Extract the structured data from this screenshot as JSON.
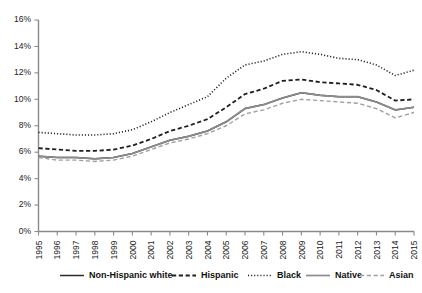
{
  "chart_data": {
    "type": "line",
    "title": "",
    "subtitle": "",
    "xlabel": "",
    "ylabel": "",
    "grid": false,
    "legend_position": "bottom",
    "xlim": [
      1995,
      2015
    ],
    "ylim": [
      0,
      16
    ],
    "ytick_labels": [
      "0%",
      "2%",
      "4%",
      "6%",
      "8%",
      "10%",
      "12%",
      "14%",
      "16%"
    ],
    "ytick_values": [
      0,
      2,
      4,
      6,
      8,
      10,
      12,
      14,
      16
    ],
    "x": [
      1995,
      1996,
      1997,
      1998,
      1999,
      2000,
      2001,
      2002,
      2003,
      2004,
      2005,
      2006,
      2007,
      2008,
      2009,
      2010,
      2011,
      2012,
      2013,
      2014,
      2015
    ],
    "xtick_labels": [
      "1995",
      "1996",
      "1997",
      "1998",
      "1999",
      "2000",
      "2001",
      "2002",
      "2003",
      "2004",
      "2005",
      "2006",
      "2007",
      "2008",
      "2009",
      "2010",
      "2011",
      "2012",
      "2013",
      "2014",
      "2015"
    ],
    "series": [
      {
        "name": "Non-Hispanic white",
        "style": "solid",
        "color": "#2b2b2b",
        "width": 1.5,
        "values": [
          5.7,
          5.6,
          5.6,
          5.5,
          5.6,
          5.9,
          6.4,
          6.9,
          7.2,
          7.6,
          8.3,
          9.3,
          9.6,
          10.1,
          10.5,
          10.3,
          10.2,
          10.2,
          9.8,
          9.2,
          9.4
        ]
      },
      {
        "name": "Hispanic",
        "style": "dashed",
        "color": "#1f1f1f",
        "width": 1.8,
        "values": [
          6.3,
          6.2,
          6.1,
          6.1,
          6.2,
          6.5,
          7.0,
          7.6,
          8.0,
          8.5,
          9.4,
          10.4,
          10.8,
          11.4,
          11.5,
          11.3,
          11.2,
          11.1,
          10.7,
          9.9,
          10.0
        ]
      },
      {
        "name": "Black",
        "style": "dotted",
        "color": "#1f1f1f",
        "width": 1.6,
        "values": [
          7.5,
          7.4,
          7.3,
          7.3,
          7.4,
          7.7,
          8.3,
          9.0,
          9.6,
          10.2,
          11.6,
          12.6,
          12.9,
          13.4,
          13.6,
          13.4,
          13.1,
          13.0,
          12.6,
          11.8,
          12.2
        ]
      },
      {
        "name": "Native",
        "style": "solid",
        "color": "#8c8c8c",
        "width": 1.7,
        "values": [
          5.7,
          5.6,
          5.6,
          5.5,
          5.6,
          5.9,
          6.4,
          6.9,
          7.2,
          7.6,
          8.3,
          9.3,
          9.6,
          10.1,
          10.5,
          10.3,
          10.2,
          10.2,
          9.8,
          9.2,
          9.4
        ]
      },
      {
        "name": "Asian",
        "style": "dashed",
        "color": "#a0a0a0",
        "width": 1.4,
        "values": [
          5.6,
          5.4,
          5.4,
          5.3,
          5.4,
          5.7,
          6.2,
          6.7,
          7.0,
          7.4,
          8.0,
          8.9,
          9.2,
          9.7,
          10.0,
          9.9,
          9.8,
          9.7,
          9.3,
          8.6,
          9.0
        ]
      }
    ]
  },
  "legend": {
    "items": [
      {
        "label": "Non-Hispanic white"
      },
      {
        "label": "Hispanic"
      },
      {
        "label": "Black"
      },
      {
        "label": "Native"
      },
      {
        "label": "Asian"
      }
    ]
  }
}
